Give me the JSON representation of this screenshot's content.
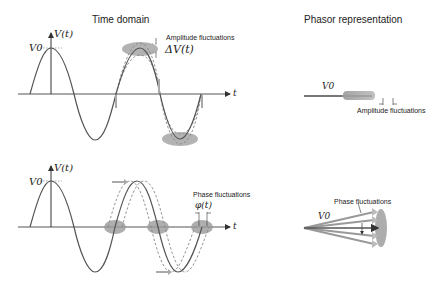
{
  "titles": {
    "time_domain": "Time domain",
    "phasor": "Phasor representation"
  },
  "top": {
    "y_axis_label": "V(t)",
    "v0_label": "V0",
    "t_label": "t",
    "annotation_title": "Amplitude fluctuations",
    "annotation_math": "ΔV(t)",
    "phasor_v0": "V0",
    "phasor_annotation": "Amplitude fluctuations"
  },
  "bottom": {
    "y_axis_label": "V(t)",
    "v0_label": "V0",
    "t_label": "t",
    "annotation_title": "Phase fluctuations",
    "annotation_math": "φ(t)",
    "phasor_v0": "V0",
    "phasor_annotation": "Phase fluctuations"
  },
  "colors": {
    "curve": "#555555",
    "dashed": "#888888",
    "blob": "#9a9a9a",
    "arrow_fill": "#aaaaaa"
  }
}
